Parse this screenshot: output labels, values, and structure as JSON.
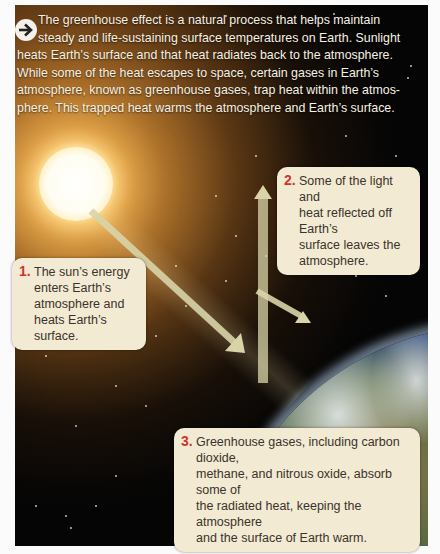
{
  "intro": {
    "icon": "arrow-right-circle-icon",
    "line1": "The greenhouse effect is a natural process that helps maintain",
    "line2": "steady and life-sustaining surface temperatures on Earth. Sunlight",
    "line3": "heats Earth’s surface and that heat radiates back to the atmosphere.",
    "line4": "While some of the heat escapes to space, certain gases in Earth’s",
    "line5": "atmosphere, known as greenhouse gases, trap heat within the atmos-",
    "line6": "phere. This  trapped heat warms the atmosphere and Earth’s surface."
  },
  "callouts": [
    {
      "number": "1.",
      "lines": [
        "The sun’s energy",
        "enters Earth’s",
        "atmosphere and",
        "heats Earth’s surface."
      ]
    },
    {
      "number": "2.",
      "lines": [
        "Some of the light and",
        "heat reflected off Earth’s",
        "surface leaves the",
        "atmosphere."
      ]
    },
    {
      "number": "3.",
      "lines": [
        "Greenhouse gases, including carbon dioxide,",
        "methane, and nitrous oxide, absorb some of",
        "the radiated heat, keeping the atmosphere",
        "and the surface of Earth warm."
      ]
    }
  ],
  "colors": {
    "callout_bg": "#f3ead3",
    "number_red": "#d0342c",
    "arrow_fill": "#d8d4a8",
    "space": "#050505",
    "sun_glow": "#f0af50"
  }
}
